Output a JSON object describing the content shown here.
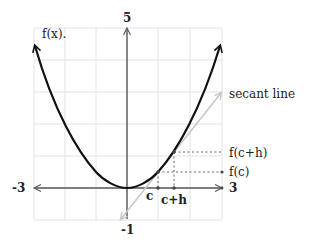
{
  "diagram": {
    "function_label": "f(x).",
    "secant_label": "secant line",
    "axis": {
      "x_min_label": "-3",
      "x_max_label": "3",
      "y_max_label": "5",
      "y_min_label": "-1"
    },
    "points": {
      "c_label": "c",
      "ch_label": "c+h",
      "fc_label": "f(c)",
      "fch_label": "f(c+h)"
    },
    "colors": {
      "curve": "#111111",
      "secant": "#c8c8c8",
      "grid": "#e0e0e0",
      "axis": "#555555",
      "guides": "#666666"
    }
  }
}
